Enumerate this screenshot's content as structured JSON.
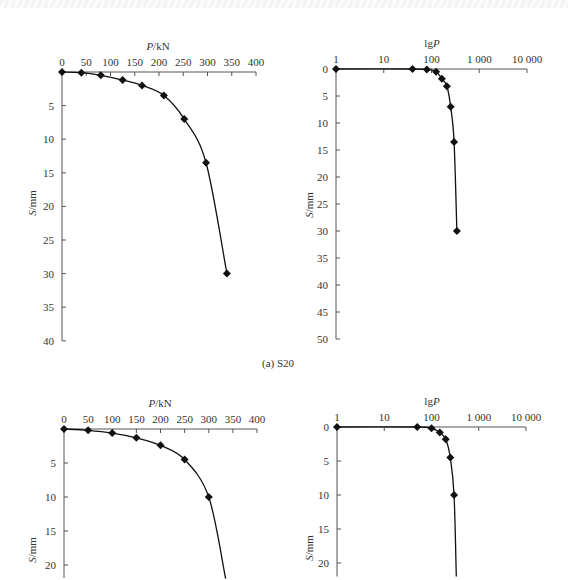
{
  "caption_a": "(a) S20",
  "chart_data": [
    {
      "id": "a-linear",
      "type": "line",
      "title": "",
      "xlabel": "P/kN",
      "ylabel": "S/mm",
      "x_ticks": [
        "0",
        "50",
        "100",
        "150",
        "200",
        "250",
        "300",
        "350",
        "400"
      ],
      "y_ticks": [
        "5",
        "10",
        "15",
        "20",
        "25",
        "30",
        "35",
        "40"
      ],
      "xlim": [
        0,
        400
      ],
      "ylim": [
        0,
        40
      ],
      "x_axis_position": "top",
      "y_inverted": true,
      "x": [
        0,
        40,
        80,
        125,
        165,
        210,
        252,
        297,
        340
      ],
      "values": [
        0,
        0.1,
        0.5,
        1.2,
        2.0,
        3.5,
        7.0,
        13.5,
        30.0
      ]
    },
    {
      "id": "a-log",
      "type": "line",
      "title": "",
      "xlabel": "lgP",
      "ylabel": "S/mm",
      "x_scale": "log",
      "x_ticks": [
        "1",
        "10",
        "100",
        "1 000",
        "10 000"
      ],
      "y_ticks": [
        "0",
        "5",
        "10",
        "15",
        "20",
        "25",
        "30",
        "35",
        "40",
        "45",
        "50"
      ],
      "xlim": [
        1,
        10000
      ],
      "ylim": [
        0,
        50
      ],
      "x_axis_position": "top",
      "y_inverted": true,
      "x": [
        1,
        40,
        80,
        125,
        165,
        210,
        252,
        297,
        340
      ],
      "values": [
        0,
        0,
        0.1,
        0.5,
        1.8,
        3.2,
        7.0,
        13.5,
        30.0
      ]
    },
    {
      "id": "b-linear",
      "type": "line",
      "title": "",
      "xlabel": "P/kN",
      "ylabel": "S/mm",
      "x_ticks": [
        "0",
        "50",
        "100",
        "150",
        "200",
        "250",
        "300",
        "350",
        "400"
      ],
      "y_ticks": [
        "5",
        "10",
        "15",
        "20"
      ],
      "xlim": [
        0,
        400
      ],
      "ylim": [
        0,
        22
      ],
      "x_axis_position": "top",
      "y_inverted": true,
      "x": [
        0,
        50,
        100,
        150,
        200,
        250,
        300,
        335
      ],
      "values": [
        0,
        0.2,
        0.6,
        1.3,
        2.4,
        4.5,
        10.0,
        22.0
      ]
    },
    {
      "id": "b-log",
      "type": "line",
      "title": "",
      "xlabel": "lgP",
      "ylabel": "S/mm",
      "x_scale": "log",
      "x_ticks": [
        "1",
        "10",
        "100",
        "1 000",
        "10 000"
      ],
      "y_ticks": [
        "0",
        "5",
        "10",
        "15",
        "20"
      ],
      "xlim": [
        1,
        10000
      ],
      "ylim": [
        0,
        22
      ],
      "x_axis_position": "top",
      "y_inverted": true,
      "x": [
        1,
        50,
        100,
        150,
        200,
        250,
        300,
        335
      ],
      "values": [
        0,
        0,
        0.2,
        0.8,
        1.8,
        4.5,
        10.0,
        22.0
      ]
    }
  ]
}
